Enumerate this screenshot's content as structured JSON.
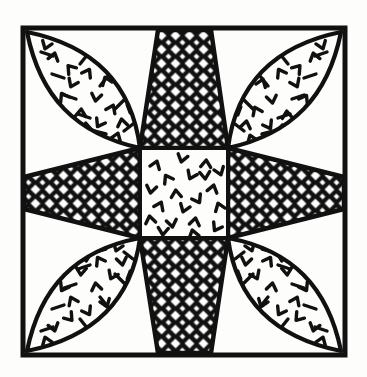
{
  "figure": {
    "kind": "line-drawing",
    "background_color": "#fdfdfb",
    "ink_color": "#111111"
  },
  "canvas": {
    "width": 367,
    "height": 377
  },
  "frame": {
    "label": "outer border square",
    "x": 23,
    "y": 28,
    "width": 322,
    "height": 327,
    "stroke_width": 5,
    "color": "#111111"
  },
  "center_square": {
    "label": "center patch",
    "x": 140,
    "y": 148,
    "width": 88,
    "height": 90,
    "fill_pattern": "speckle-chevron",
    "stroke_width": 4,
    "color": "#111111"
  },
  "star_points": {
    "label": "cross-hatched star points",
    "count": 4,
    "fill_pattern": "diamond-lattice",
    "lattice_spacing": 14,
    "lattice_stroke": 4,
    "color": "#111111",
    "items": [
      {
        "name": "star-point-north",
        "direction": "north",
        "tip_x": 184,
        "tip_y": 30
      },
      {
        "name": "star-point-east",
        "direction": "east",
        "tip_x": 344,
        "tip_y": 193
      },
      {
        "name": "star-point-south",
        "direction": "south",
        "tip_x": 184,
        "tip_y": 353
      },
      {
        "name": "star-point-west",
        "direction": "west",
        "tip_x": 24,
        "tip_y": 193
      }
    ]
  },
  "petals": {
    "label": "speckled leaf petals",
    "count": 4,
    "fill_pattern": "speckle-chevron",
    "edge_ticks": true,
    "stroke_width": 4,
    "color": "#111111",
    "items": [
      {
        "name": "petal-northwest",
        "corner": "top-left",
        "from_x": 27,
        "from_y": 32,
        "to_x": 140,
        "to_y": 148
      },
      {
        "name": "petal-northeast",
        "corner": "top-right",
        "from_x": 341,
        "from_y": 32,
        "to_x": 228,
        "to_y": 148
      },
      {
        "name": "petal-southeast",
        "corner": "bottom-right",
        "from_x": 341,
        "from_y": 351,
        "to_x": 228,
        "to_y": 238
      },
      {
        "name": "petal-southwest",
        "corner": "bottom-left",
        "from_x": 27,
        "from_y": 351,
        "to_x": 140,
        "to_y": 238
      }
    ]
  },
  "texture": {
    "speckle_glyph": "chevron-tick",
    "speckle_count_center": 20,
    "speckle_count_petal": 16
  }
}
